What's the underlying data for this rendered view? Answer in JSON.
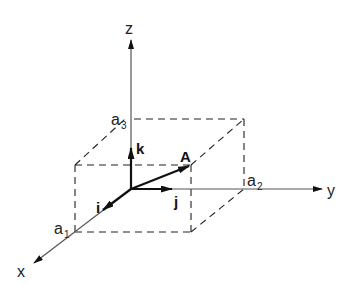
{
  "diagram": {
    "type": "3d-cartesian-vector",
    "axes": {
      "x": {
        "label": "x"
      },
      "y": {
        "label": "y"
      },
      "z": {
        "label": "z"
      }
    },
    "unit_vectors": {
      "i": {
        "label": "i"
      },
      "j": {
        "label": "j"
      },
      "k": {
        "label": "k"
      }
    },
    "vector": {
      "label": "A"
    },
    "components": {
      "a1": {
        "base": "a",
        "sub": "1"
      },
      "a2": {
        "base": "a",
        "sub": "2"
      },
      "a3": {
        "base": "a",
        "sub": "3"
      }
    },
    "colors": {
      "axis": "#555555",
      "vector": "#111111",
      "dashes": "#222222",
      "background": "#ffffff"
    }
  }
}
